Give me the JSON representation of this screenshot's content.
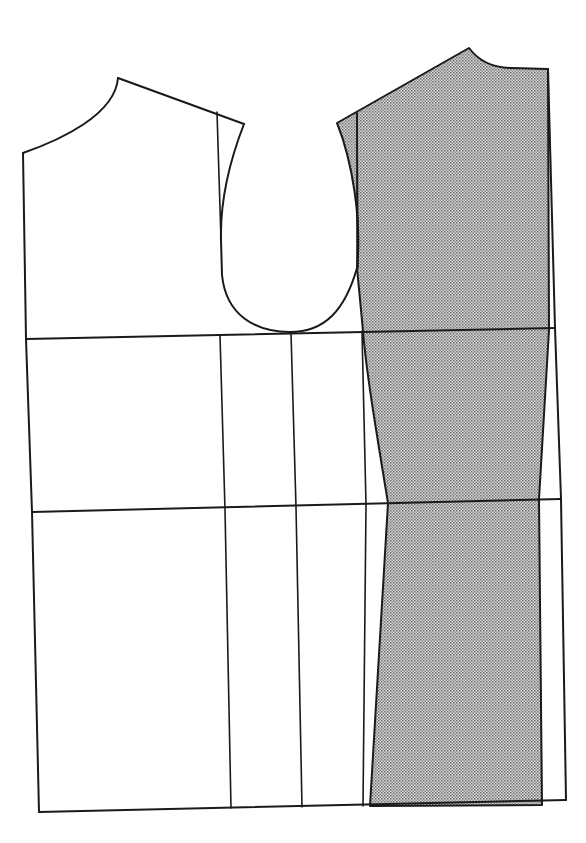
{
  "diagram": {
    "type": "sewing-pattern-draft",
    "description": "Bodice pattern draft: back piece (left, unshaded) and front piece (right, shaded with dot screen), with chest line, waist line, and hem line",
    "colors": {
      "line": "#1a1a1a",
      "background": "#ffffff",
      "shade_fill": "#c8c8c8",
      "shade_dot": "#6e6e6e"
    },
    "pieces": [
      {
        "name": "back-bodice",
        "shaded": false
      },
      {
        "name": "front-bodice",
        "shaded": true
      }
    ],
    "guide_lines": [
      {
        "name": "chest-line"
      },
      {
        "name": "waist-line"
      },
      {
        "name": "hem-line"
      }
    ]
  }
}
